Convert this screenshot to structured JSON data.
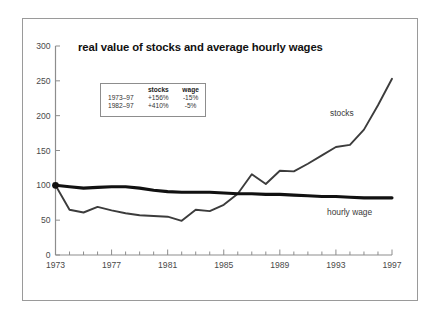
{
  "frame": {
    "border_color": "#9a9a9a",
    "background": "#ffffff"
  },
  "chart_data": {
    "type": "line",
    "title": "real value of stocks and average hourly wages",
    "xlabel": "",
    "ylabel": "",
    "xlim": [
      1973,
      1997
    ],
    "ylim": [
      0,
      300
    ],
    "yticks": [
      0,
      50,
      100,
      150,
      200,
      250,
      300
    ],
    "xticks": [
      1973,
      1977,
      1981,
      1985,
      1989,
      1993,
      1997
    ],
    "xtick_labels": [
      "1973",
      "1977",
      "1981",
      "1985",
      "1989",
      "1993",
      "1997"
    ],
    "ytick_labels": [
      "0",
      "50",
      "100",
      "150",
      "200",
      "250",
      "300"
    ],
    "grid": false,
    "legend_position": "inline-annotations",
    "x": [
      1973,
      1974,
      1975,
      1976,
      1977,
      1978,
      1979,
      1980,
      1981,
      1982,
      1983,
      1984,
      1985,
      1986,
      1987,
      1988,
      1989,
      1990,
      1991,
      1992,
      1993,
      1994,
      1995,
      1996,
      1997
    ],
    "series": [
      {
        "name": "stocks",
        "color": "#3c3c3c",
        "line_width": 1.9,
        "values": [
          100,
          65,
          61,
          69,
          64,
          60,
          57,
          56,
          55,
          49,
          65,
          63,
          72,
          88,
          116,
          102,
          121,
          120,
          131,
          143,
          155,
          158,
          180,
          215,
          253
        ]
      },
      {
        "name": "hourly wage",
        "color": "#111111",
        "line_width": 3.1,
        "values": [
          100,
          98,
          96,
          97,
          98,
          98,
          96,
          93,
          91,
          90,
          90,
          90,
          89,
          88,
          88,
          87,
          87,
          86,
          85,
          84,
          84,
          83,
          82,
          82,
          82
        ]
      }
    ],
    "annotations": [
      {
        "text": "stocks",
        "x": 1992,
        "y": 205
      },
      {
        "text": "hourly wage",
        "x": 1992,
        "y": 62
      }
    ],
    "origin_marker": {
      "x": 1973,
      "y": 100,
      "color": "#111111"
    }
  },
  "legend_table": {
    "columns": [
      "",
      "stocks",
      "wage"
    ],
    "rows": [
      {
        "period": "1973–97",
        "stocks": "+156%",
        "wage": "-15%"
      },
      {
        "period": "1982–97",
        "stocks": "+410%",
        "wage": "-5%"
      }
    ]
  }
}
